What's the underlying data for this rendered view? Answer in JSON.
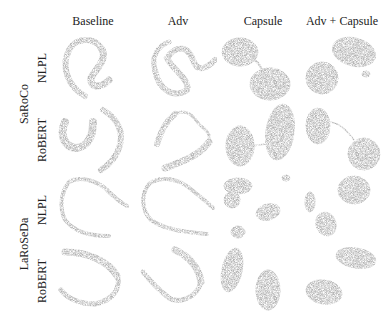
{
  "figure": {
    "columns": [
      "Baseline",
      "Adv",
      "Capsule",
      "Adv + Capsule"
    ],
    "groups": [
      {
        "name": "SaRoCo",
        "rows": [
          "NLPL",
          "RoBERT"
        ]
      },
      {
        "name": "LaRoSeDa",
        "rows": [
          "NLPL",
          "RoBERT"
        ]
      }
    ],
    "point_color": "#7a7a7a",
    "panel_description": "t-SNE style scatter embeddings per model/method"
  }
}
